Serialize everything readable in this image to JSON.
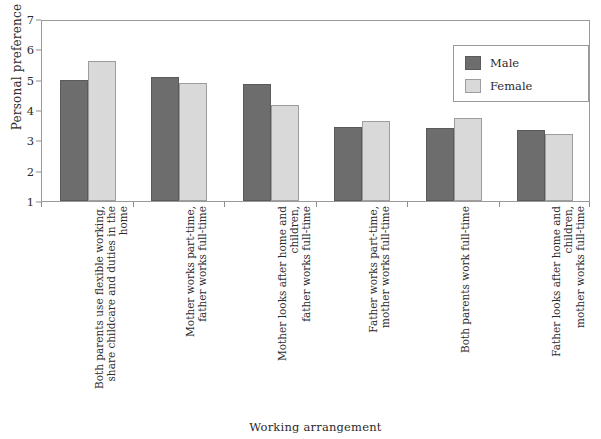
{
  "top_caption": "",
  "chart_data": {
    "type": "bar",
    "title": "",
    "xlabel": "Working arrangement",
    "ylabel": "Personal preference",
    "ylim": [
      1,
      7
    ],
    "yticks": [
      1,
      2,
      3,
      4,
      5,
      6,
      7
    ],
    "grid": false,
    "legend_position": "top-right",
    "categories": [
      "Both parents use flexible working,\nshare childcare and duties in the home",
      "Mother works part-time,\nfather works full-time",
      "Mother looks after home and children,\nfather works full-time",
      "Father works part-time,\nmother works full-time",
      "Both parents work full-time",
      "Father looks after home and children,\nmother works full-time"
    ],
    "series": [
      {
        "name": "Male",
        "color": "#6d6d6d",
        "values": [
          5.0,
          5.1,
          4.85,
          3.45,
          3.4,
          3.35
        ]
      },
      {
        "name": "Female",
        "color": "#d9d9d9",
        "values": [
          5.6,
          4.9,
          4.15,
          3.65,
          3.75,
          3.2
        ]
      }
    ]
  },
  "legend": {
    "items": [
      {
        "label": "Male"
      },
      {
        "label": "Female"
      }
    ]
  },
  "colors": {
    "male": "#6d6d6d",
    "female": "#d9d9d9",
    "axis": "#9a9a9a",
    "text": "#2d2a2b"
  }
}
